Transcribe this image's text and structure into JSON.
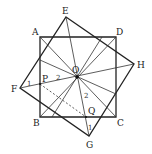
{
  "diagram": {
    "type": "geometry",
    "points": {
      "A": {
        "label": "A",
        "x": 40,
        "y": 37
      },
      "B": {
        "label": "B",
        "x": 40,
        "y": 117
      },
      "C": {
        "label": "C",
        "x": 116,
        "y": 117
      },
      "D": {
        "label": "D",
        "x": 116,
        "y": 37
      },
      "E": {
        "label": "E",
        "x": 66,
        "y": 17
      },
      "F": {
        "label": "F",
        "x": 20,
        "y": 88
      },
      "G": {
        "label": "G",
        "x": 89,
        "y": 136
      },
      "H": {
        "label": "H",
        "x": 134,
        "y": 64
      },
      "O": {
        "label": "O",
        "x": 77,
        "y": 77
      },
      "P": {
        "label": "P",
        "x": 40,
        "y": 84
      },
      "Q": {
        "label": "Q",
        "x": 86,
        "y": 117
      }
    },
    "angle_marks": [
      {
        "label": "1",
        "near": "F"
      },
      {
        "label": "2",
        "near": "O",
        "side": "OP"
      },
      {
        "label": "2",
        "near": "O",
        "side": "OQ"
      },
      {
        "label": "1",
        "near": "G"
      }
    ],
    "dashed_segments": [
      "PQ"
    ]
  }
}
